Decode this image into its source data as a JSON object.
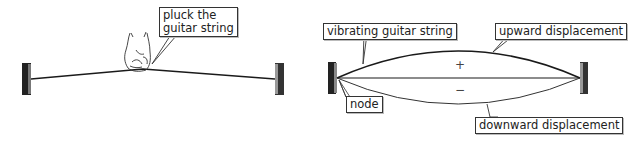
{
  "left_panel": {
    "label_pluck": [
      "pluck the",
      "guitar string"
    ],
    "elements": [
      "left-anchor",
      "plucked-string",
      "hand-plucking",
      "right-anchor"
    ]
  },
  "right_panel": {
    "labels": {
      "vibrating": "vibrating guitar string",
      "upward": "upward displacement",
      "downward": "downward displacement",
      "node": "node"
    },
    "signs": {
      "plus": "+",
      "minus": "−"
    }
  },
  "colors": {
    "line": "#1a1a1a",
    "label_border": "#333333",
    "background": "#ffffff"
  }
}
